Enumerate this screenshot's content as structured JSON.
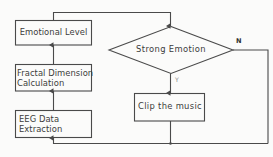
{
  "diagram": {
    "type": "flowchart",
    "stroke_color": "#4a4a4a",
    "background_color": "#fbfbfa",
    "text_color": "#3b3b3b",
    "nodes": {
      "emotional_level": {
        "shape": "process",
        "label": "Emotional Level"
      },
      "fractal_dimension": {
        "shape": "process",
        "line1": "Fractal Dimension",
        "line2": "Calculation"
      },
      "eeg_extraction": {
        "shape": "process",
        "line1": "EEG Data",
        "line2": "Extraction"
      },
      "strong_emotion": {
        "shape": "decision",
        "label": "Strong Emotion"
      },
      "clip_music": {
        "shape": "process",
        "label": "Clip the music"
      }
    },
    "branches": {
      "no_label": "N",
      "yes_label": "Y"
    },
    "edges": [
      {
        "from": "eeg_extraction",
        "to": "fractal_dimension",
        "label": ""
      },
      {
        "from": "fractal_dimension",
        "to": "emotional_level",
        "label": ""
      },
      {
        "from": "emotional_level",
        "to": "strong_emotion",
        "label": ""
      },
      {
        "from": "strong_emotion",
        "to": "clip_music",
        "label": "Y"
      },
      {
        "from": "strong_emotion",
        "to": "eeg_extraction",
        "label": "N"
      },
      {
        "from": "clip_music",
        "to": "eeg_extraction",
        "label": ""
      }
    ]
  }
}
